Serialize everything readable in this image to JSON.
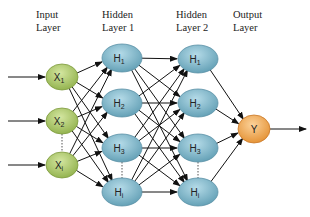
{
  "diagram": {
    "type": "feedforward-neural-network",
    "layers": [
      {
        "label_line1": "Input",
        "label_line2": "Layer",
        "color": "#a8c65a",
        "nodes": [
          {
            "name": "X",
            "sub": "1"
          },
          {
            "name": "X",
            "sub": "2"
          },
          {
            "name": "X",
            "sub": "i"
          }
        ]
      },
      {
        "label_line1": "Hidden",
        "label_line2": "Layer 1",
        "color": "#7fb6c9",
        "nodes": [
          {
            "name": "H",
            "sub": "1"
          },
          {
            "name": "H",
            "sub": "2"
          },
          {
            "name": "H",
            "sub": "3"
          },
          {
            "name": "H",
            "sub": "i"
          }
        ]
      },
      {
        "label_line1": "Hidden",
        "label_line2": "Layer 2",
        "color": "#7fb6c9",
        "nodes": [
          {
            "name": "H",
            "sub": "1"
          },
          {
            "name": "H",
            "sub": "2"
          },
          {
            "name": "H",
            "sub": "3"
          },
          {
            "name": "H",
            "sub": "i"
          }
        ]
      },
      {
        "label_line1": "Output",
        "label_line2": "Layer",
        "color": "#f0a850",
        "nodes": [
          {
            "name": "Y",
            "sub": ""
          }
        ]
      }
    ],
    "ellipsis_marker": "dotted-line"
  }
}
